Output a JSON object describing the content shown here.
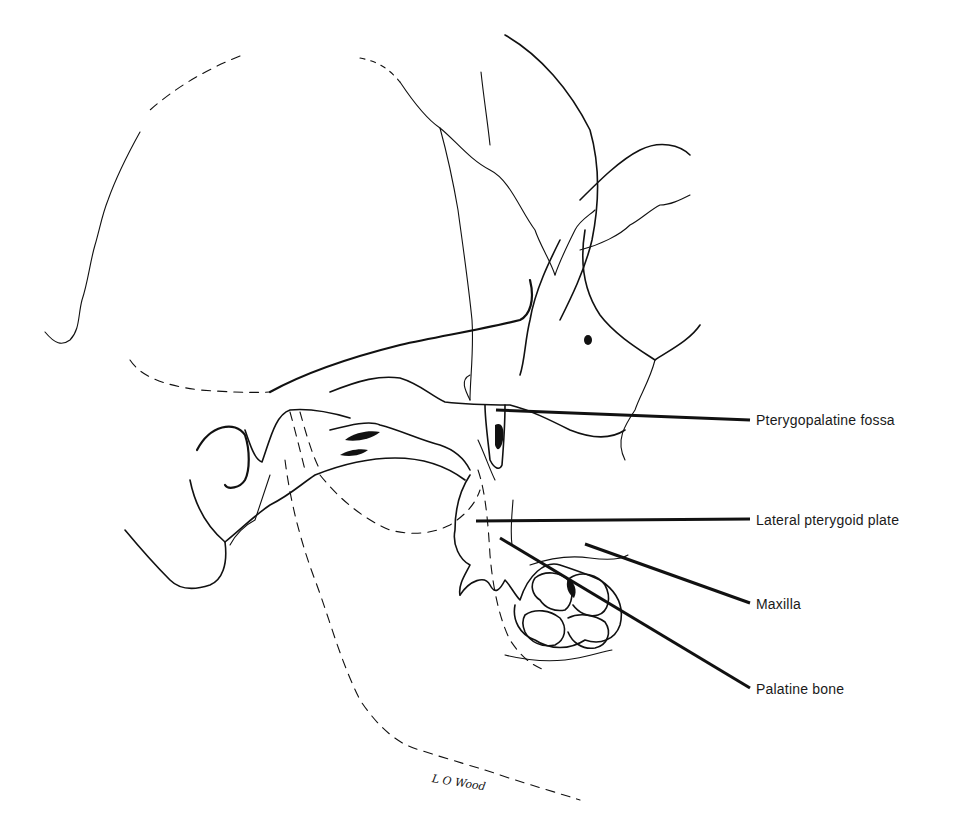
{
  "figure": {
    "labels": [
      {
        "id": "pterygopalatine-fossa",
        "text": "Pterygopalatine fossa",
        "x": 756,
        "y": 414,
        "leader": {
          "x1": 496,
          "y1": 410,
          "x2": 750,
          "y2": 420
        }
      },
      {
        "id": "lateral-pterygoid-plate",
        "text": "Lateral pterygoid plate",
        "x": 756,
        "y": 515,
        "leader": {
          "x1": 476,
          "y1": 521,
          "x2": 750,
          "y2": 519
        }
      },
      {
        "id": "maxilla",
        "text": "Maxilla",
        "x": 756,
        "y": 597,
        "leader": {
          "x1": 585,
          "y1": 544,
          "x2": 750,
          "y2": 603
        }
      },
      {
        "id": "palatine-bone",
        "text": "Palatine bone",
        "x": 756,
        "y": 685,
        "leader": {
          "x1": 500,
          "y1": 538,
          "x2": 750,
          "y2": 688
        }
      }
    ],
    "artist_signature": "L O Wood"
  }
}
